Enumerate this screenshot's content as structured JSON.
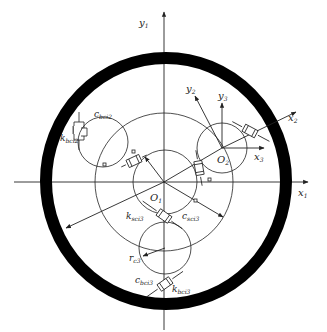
{
  "diagram": {
    "type": "planetary-gear-dynamic-model",
    "colors": {
      "ink": "#222222",
      "ring": "#000000",
      "background": "#ffffff"
    },
    "axes": {
      "x1": {
        "base": "x",
        "sub": "1"
      },
      "y1": {
        "base": "y",
        "sub": "1"
      },
      "x2": {
        "base": "x",
        "sub": "2"
      },
      "y2": {
        "base": "y",
        "sub": "2"
      },
      "x3": {
        "base": "x",
        "sub": "3"
      },
      "y3": {
        "base": "y",
        "sub": "3"
      }
    },
    "centers": {
      "O1": {
        "base": "O",
        "sub": "1"
      },
      "O2": {
        "base": "O",
        "sub": "2"
      }
    },
    "parameters": {
      "c_bci2": {
        "base": "c",
        "sub": "bci2"
      },
      "k_bci2": {
        "base": "k",
        "sub": "bci2"
      },
      "k_sci3": {
        "base": "k",
        "sub": "sci3"
      },
      "c_sci3": {
        "base": "c",
        "sub": "sci3"
      },
      "r_c3": {
        "base": "r",
        "sub": "c3"
      },
      "c_bci3": {
        "base": "c",
        "sub": "bci3"
      },
      "k_bci3": {
        "base": "k",
        "sub": "bci3"
      }
    },
    "components": {
      "ring_gear": "outer ring (thick black)",
      "sun_gear": "sun gear circle at O1",
      "carrier_circle": "planet carrier pitch circle",
      "planets": [
        "upper-left planet",
        "right planet at O2",
        "bottom planet"
      ]
    }
  }
}
